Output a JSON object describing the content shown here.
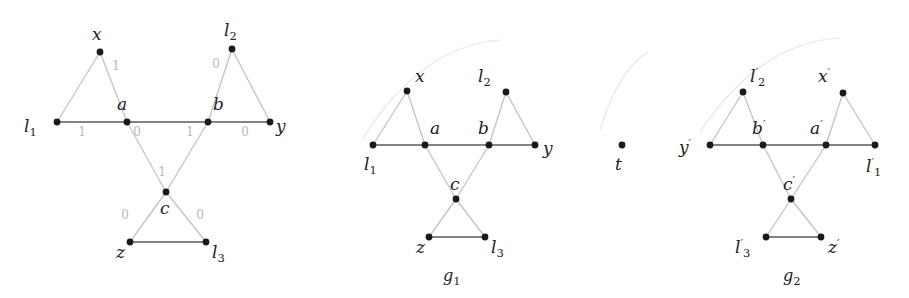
{
  "figure": {
    "type": "diagram",
    "colors": {
      "node": "#1a1a1a",
      "edge_main": "#5a5a5a",
      "edge_faint": "#c3c3c3",
      "label": "#222222",
      "edge_label": "#b9b9b9",
      "background": "#ffffff"
    }
  },
  "graphs": [
    {
      "id": "left-graph",
      "caption": "",
      "nodes": [
        {
          "id": "x",
          "label": "x",
          "sub": "",
          "prime": false,
          "x": 100,
          "y": 52,
          "lx": 92,
          "ly": 40
        },
        {
          "id": "l2",
          "label": "l",
          "sub": "2",
          "prime": false,
          "x": 232,
          "y": 49,
          "lx": 224,
          "ly": 36
        },
        {
          "id": "l1",
          "label": "l",
          "sub": "1",
          "prime": false,
          "x": 57,
          "y": 122,
          "lx": 24,
          "ly": 132
        },
        {
          "id": "a",
          "label": "a",
          "sub": "",
          "prime": false,
          "x": 127,
          "y": 122,
          "lx": 117,
          "ly": 110
        },
        {
          "id": "b",
          "label": "b",
          "sub": "",
          "prime": false,
          "x": 208,
          "y": 122,
          "lx": 213,
          "ly": 110
        },
        {
          "id": "y",
          "label": "y",
          "sub": "",
          "prime": false,
          "x": 270,
          "y": 122,
          "lx": 276,
          "ly": 132
        },
        {
          "id": "c",
          "label": "c",
          "sub": "",
          "prime": false,
          "x": 166,
          "y": 192,
          "lx": 160,
          "ly": 214
        },
        {
          "id": "z",
          "label": "z",
          "sub": "",
          "prime": false,
          "x": 130,
          "y": 242,
          "lx": 116,
          "ly": 258
        },
        {
          "id": "l3",
          "label": "l",
          "sub": "3",
          "prime": false,
          "x": 206,
          "y": 242,
          "lx": 212,
          "ly": 258
        }
      ],
      "edges": [
        {
          "from": "l1",
          "to": "x",
          "style": "faint",
          "weight": ""
        },
        {
          "from": "x",
          "to": "a",
          "style": "faint",
          "weight": "1",
          "wx": 116,
          "wy": 70
        },
        {
          "from": "l1",
          "to": "a",
          "style": "main",
          "weight": "1",
          "wx": 82,
          "wy": 136
        },
        {
          "from": "a",
          "to": "b",
          "style": "main",
          "weight": "",
          "wx": 0,
          "wy": 0
        },
        {
          "from": "b",
          "to": "y",
          "style": "main",
          "weight": "0",
          "wx": 245,
          "wy": 136
        },
        {
          "from": "b",
          "to": "l2",
          "style": "faint",
          "weight": "0",
          "wx": 216,
          "wy": 68
        },
        {
          "from": "l2",
          "to": "y",
          "style": "faint",
          "weight": ""
        },
        {
          "from": "a",
          "to": "c",
          "style": "faint",
          "weight": "0",
          "wx": 137,
          "wy": 136
        },
        {
          "from": "c",
          "to": "b",
          "style": "faint",
          "weight": "1",
          "wx": 190,
          "wy": 136
        },
        {
          "from": "c",
          "to": "z",
          "style": "faint",
          "weight": "0",
          "wx": 125,
          "wy": 219
        },
        {
          "from": "c",
          "to": "l3",
          "style": "faint",
          "weight": "0",
          "wx": 200,
          "wy": 219
        },
        {
          "from": "z",
          "to": "l3",
          "style": "main",
          "weight": ""
        }
      ],
      "center_weight": {
        "text": "1",
        "x": 162,
        "y": 176
      }
    },
    {
      "id": "g1",
      "caption": "g",
      "caption_sub": "1",
      "caption_x": 443,
      "caption_y": 281,
      "nodes": [
        {
          "id": "x",
          "label": "x",
          "sub": "",
          "prime": false,
          "x": 407,
          "y": 91,
          "lx": 415,
          "ly": 82
        },
        {
          "id": "l2",
          "label": "l",
          "sub": "2",
          "prime": false,
          "x": 506,
          "y": 92,
          "lx": 478,
          "ly": 82
        },
        {
          "id": "l1",
          "label": "l",
          "sub": "1",
          "prime": false,
          "x": 373,
          "y": 145,
          "lx": 364,
          "ly": 170
        },
        {
          "id": "a",
          "label": "a",
          "sub": "",
          "prime": false,
          "x": 425,
          "y": 145,
          "lx": 430,
          "ly": 134
        },
        {
          "id": "b",
          "label": "b",
          "sub": "",
          "prime": false,
          "x": 489,
          "y": 145,
          "lx": 478,
          "ly": 134
        },
        {
          "id": "y",
          "label": "y",
          "sub": "",
          "prime": false,
          "x": 535,
          "y": 145,
          "lx": 543,
          "ly": 154
        },
        {
          "id": "c",
          "label": "c",
          "sub": "",
          "prime": false,
          "x": 456,
          "y": 199,
          "lx": 450,
          "ly": 190
        },
        {
          "id": "z",
          "label": "z",
          "sub": "",
          "prime": false,
          "x": 429,
          "y": 237,
          "lx": 416,
          "ly": 253
        },
        {
          "id": "l3",
          "label": "l",
          "sub": "3",
          "prime": false,
          "x": 485,
          "y": 237,
          "lx": 491,
          "ly": 253
        }
      ],
      "edges": [
        {
          "from": "l1",
          "to": "x",
          "style": "faint",
          "weight": ""
        },
        {
          "from": "x",
          "to": "a",
          "style": "faint",
          "weight": ""
        },
        {
          "from": "l1",
          "to": "a",
          "style": "main",
          "weight": ""
        },
        {
          "from": "a",
          "to": "b",
          "style": "main",
          "weight": ""
        },
        {
          "from": "b",
          "to": "y",
          "style": "main",
          "weight": ""
        },
        {
          "from": "b",
          "to": "l2",
          "style": "faint",
          "weight": ""
        },
        {
          "from": "l2",
          "to": "y",
          "style": "faint",
          "weight": ""
        },
        {
          "from": "a",
          "to": "c",
          "style": "faint",
          "weight": ""
        },
        {
          "from": "c",
          "to": "b",
          "style": "faint",
          "weight": ""
        },
        {
          "from": "c",
          "to": "z",
          "style": "faint",
          "weight": ""
        },
        {
          "from": "c",
          "to": "l3",
          "style": "faint",
          "weight": ""
        },
        {
          "from": "z",
          "to": "l3",
          "style": "main",
          "weight": ""
        }
      ]
    },
    {
      "id": "g2",
      "caption": "g",
      "caption_sub": "2",
      "caption_x": 783,
      "caption_y": 281,
      "nodes": [
        {
          "id": "l2p",
          "label": "l",
          "sub": "2",
          "prime": true,
          "x": 743,
          "y": 92,
          "lx": 750,
          "ly": 82
        },
        {
          "id": "xp",
          "label": "x",
          "sub": "",
          "prime": true,
          "x": 843,
          "y": 93,
          "lx": 818,
          "ly": 82
        },
        {
          "id": "yp",
          "label": "y",
          "sub": "",
          "prime": true,
          "x": 710,
          "y": 145,
          "lx": 679,
          "ly": 153
        },
        {
          "id": "bp",
          "label": "b",
          "sub": "",
          "prime": true,
          "x": 763,
          "y": 145,
          "lx": 752,
          "ly": 134
        },
        {
          "id": "ap",
          "label": "a",
          "sub": "",
          "prime": true,
          "x": 826,
          "y": 145,
          "lx": 810,
          "ly": 134
        },
        {
          "id": "l1p",
          "label": "l",
          "sub": "1",
          "prime": true,
          "x": 875,
          "y": 145,
          "lx": 866,
          "ly": 172
        },
        {
          "id": "cp",
          "label": "c",
          "sub": "",
          "prime": true,
          "x": 791,
          "y": 199,
          "lx": 783,
          "ly": 190
        },
        {
          "id": "l3p",
          "label": "l",
          "sub": "3",
          "prime": true,
          "x": 766,
          "y": 237,
          "lx": 735,
          "ly": 253
        },
        {
          "id": "zp",
          "label": "z",
          "sub": "",
          "prime": true,
          "x": 821,
          "y": 237,
          "lx": 828,
          "ly": 253
        }
      ],
      "edges": [
        {
          "from": "yp",
          "to": "l2p",
          "style": "faint",
          "weight": ""
        },
        {
          "from": "l2p",
          "to": "bp",
          "style": "faint",
          "weight": ""
        },
        {
          "from": "yp",
          "to": "bp",
          "style": "main",
          "weight": ""
        },
        {
          "from": "bp",
          "to": "ap",
          "style": "main",
          "weight": ""
        },
        {
          "from": "ap",
          "to": "l1p",
          "style": "main",
          "weight": ""
        },
        {
          "from": "ap",
          "to": "xp",
          "style": "faint",
          "weight": ""
        },
        {
          "from": "xp",
          "to": "l1p",
          "style": "faint",
          "weight": ""
        },
        {
          "from": "bp",
          "to": "cp",
          "style": "faint",
          "weight": ""
        },
        {
          "from": "cp",
          "to": "ap",
          "style": "faint",
          "weight": ""
        },
        {
          "from": "cp",
          "to": "l3p",
          "style": "faint",
          "weight": ""
        },
        {
          "from": "cp",
          "to": "zp",
          "style": "faint",
          "weight": ""
        },
        {
          "from": "l3p",
          "to": "zp",
          "style": "main",
          "weight": ""
        }
      ]
    }
  ],
  "isolated_vertex": {
    "id": "t",
    "label": "t",
    "x": 622,
    "y": 145,
    "lx": 615,
    "ly": 170
  },
  "ghost_arcs": [
    {
      "d": "M 362 140 Q 420 46 500 40"
    },
    {
      "d": "M 600 130 Q 618 70 648 52"
    },
    {
      "d": "M 700 132 Q 760 42 840 38"
    }
  ]
}
